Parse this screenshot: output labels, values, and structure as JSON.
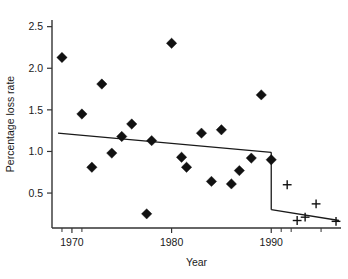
{
  "chart_data": {
    "type": "scatter",
    "title": "",
    "xlabel": "Year",
    "ylabel": "Percentage loss rate",
    "xlim": [
      1968.0,
      1997.0
    ],
    "ylim": [
      0.08,
      2.58
    ],
    "grid": false,
    "legend": "none",
    "xticks": [
      1970,
      1980,
      1990
    ],
    "xtick_labels": [
      "1970",
      "1980",
      "1990"
    ],
    "yticks": [
      0.5,
      1.0,
      1.5,
      2.0,
      2.5
    ],
    "ytick_labels": [
      "0.5",
      "1.0",
      "1.5",
      "2.0",
      "2.5"
    ],
    "x_minor_ticks": [
      1969,
      1971,
      1991,
      1992,
      1995
    ],
    "series": [
      {
        "name": "Pre-1990 annual loss rate",
        "marker": "diamond",
        "points": [
          {
            "x": 1969.0,
            "y": 2.13
          },
          {
            "x": 1971.0,
            "y": 1.45
          },
          {
            "x": 1972.0,
            "y": 0.81
          },
          {
            "x": 1973.0,
            "y": 1.81
          },
          {
            "x": 1974.0,
            "y": 0.98
          },
          {
            "x": 1975.0,
            "y": 1.18
          },
          {
            "x": 1976.0,
            "y": 1.33
          },
          {
            "x": 1977.5,
            "y": 0.25
          },
          {
            "x": 1978.0,
            "y": 1.13
          },
          {
            "x": 1980.0,
            "y": 2.3
          },
          {
            "x": 1981.0,
            "y": 0.93
          },
          {
            "x": 1981.5,
            "y": 0.81
          },
          {
            "x": 1983.0,
            "y": 1.22
          },
          {
            "x": 1984.0,
            "y": 0.64
          },
          {
            "x": 1985.0,
            "y": 1.26
          },
          {
            "x": 1986.0,
            "y": 0.61
          },
          {
            "x": 1986.8,
            "y": 0.77
          },
          {
            "x": 1988.0,
            "y": 0.92
          },
          {
            "x": 1989.0,
            "y": 1.68
          },
          {
            "x": 1990.0,
            "y": 0.9
          }
        ]
      },
      {
        "name": "Post-1990 annual loss rate",
        "marker": "plus",
        "points": [
          {
            "x": 1991.6,
            "y": 0.6
          },
          {
            "x": 1992.6,
            "y": 0.17
          },
          {
            "x": 1993.4,
            "y": 0.21
          },
          {
            "x": 1994.5,
            "y": 0.37
          },
          {
            "x": 1996.5,
            "y": 0.16
          }
        ]
      }
    ],
    "fitted_lines": [
      {
        "name": "pre-1990 trend",
        "x0": 1968.6,
        "y0": 1.22,
        "x1": 1990.0,
        "y1": 0.99
      },
      {
        "name": "step drop at 1990",
        "x0": 1990.0,
        "y0": 0.99,
        "x1": 1990.0,
        "y1": 0.3
      },
      {
        "name": "post-1990 trend",
        "x0": 1990.0,
        "y0": 0.3,
        "x1": 1996.8,
        "y1": 0.17
      }
    ]
  }
}
